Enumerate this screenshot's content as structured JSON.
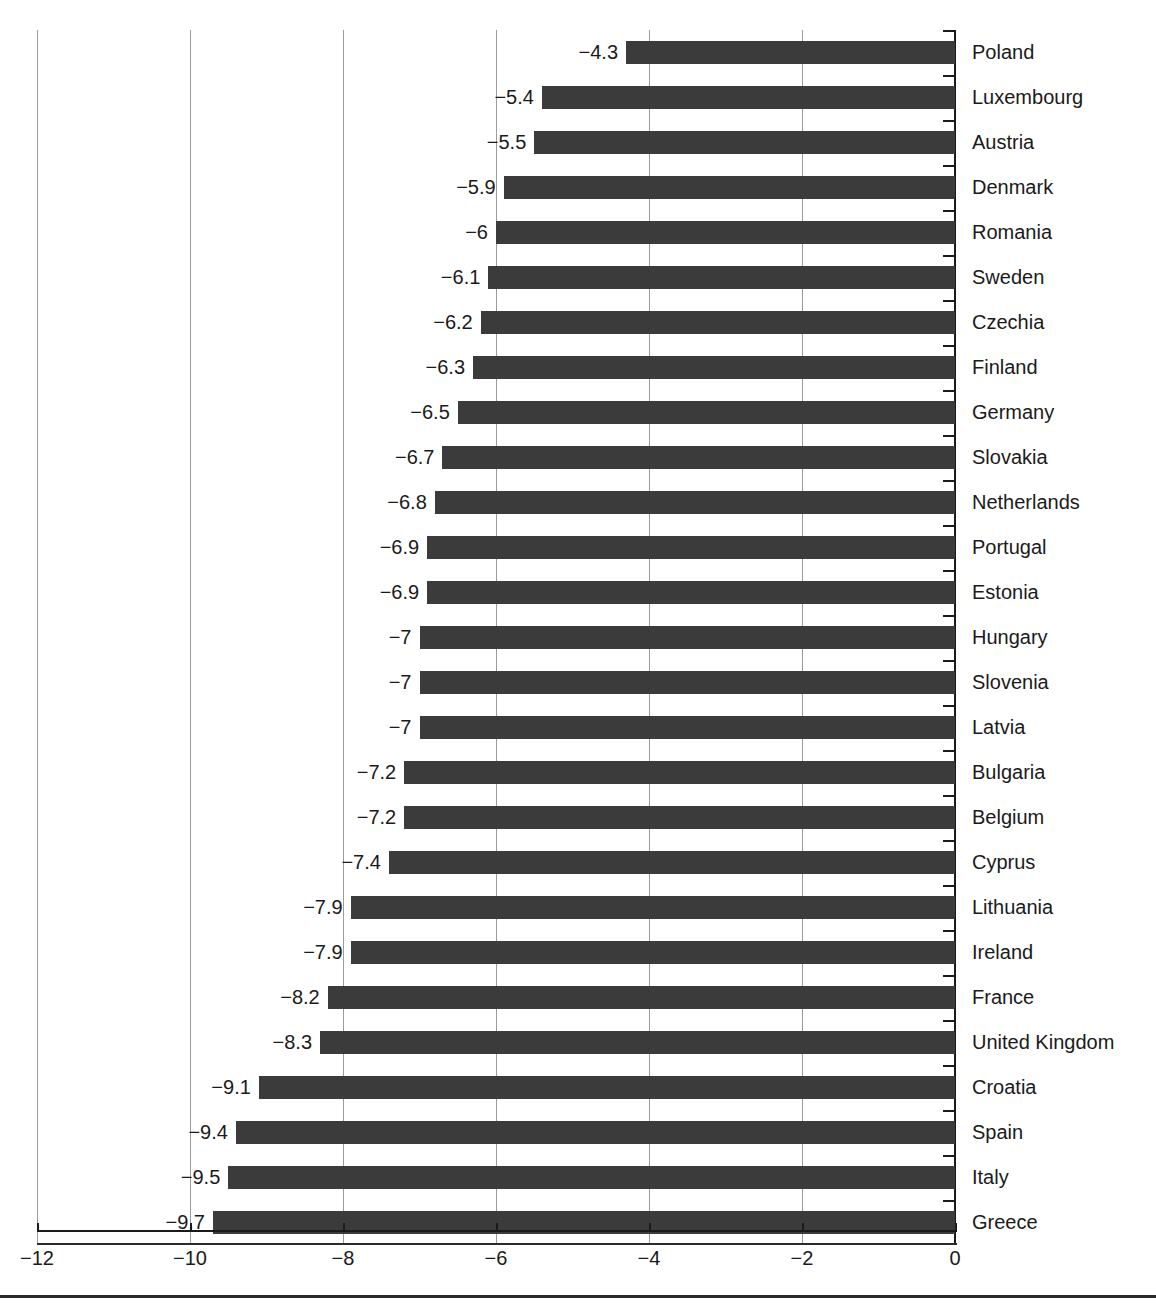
{
  "title": "",
  "axis": {
    "x_ticks": [
      "−12",
      "−10",
      "−8",
      "−6",
      "−4",
      "−2",
      "0"
    ]
  },
  "chart_data": {
    "type": "bar",
    "orientation": "horizontal",
    "title": "",
    "subtitle": "",
    "xlabel": "",
    "ylabel": "",
    "xlim": [
      -12,
      0
    ],
    "xticks": [
      -12,
      -10,
      -8,
      -6,
      -4,
      -2,
      0
    ],
    "xtick_labels": [
      "−12",
      "−10",
      "−8",
      "−6",
      "−4",
      "−2",
      "0"
    ],
    "grid": true,
    "grid_axis": "x",
    "legend": false,
    "bar_color": "#3b3b3b",
    "background_color": "#ffffff",
    "value_labels": true,
    "categories": [
      "Poland",
      "Luxembourg",
      "Austria",
      "Denmark",
      "Romania",
      "Sweden",
      "Czechia",
      "Finland",
      "Germany",
      "Slovakia",
      "Netherlands",
      "Portugal",
      "Estonia",
      "Hungary",
      "Slovenia",
      "Latvia",
      "Bulgaria",
      "Belgium",
      "Cyprus",
      "Lithuania",
      "Ireland",
      "France",
      "United Kingdom",
      "Croatia",
      "Spain",
      "Italy",
      "Greece"
    ],
    "values": [
      -4.3,
      -5.4,
      -5.5,
      -5.9,
      -6,
      -6.1,
      -6.2,
      -6.3,
      -6.5,
      -6.7,
      -6.8,
      -6.9,
      -6.9,
      -7,
      -7,
      -7,
      -7.2,
      -7.2,
      -7.4,
      -7.9,
      -7.9,
      -8.2,
      -8.3,
      -9.1,
      -9.4,
      -9.5,
      -9.7
    ],
    "value_label_texts": [
      "−4.3",
      "−5.4",
      "−5.5",
      "−5.9",
      "−6",
      "−6.1",
      "−6.2",
      "−6.3",
      "−6.5",
      "−6.7",
      "−6.8",
      "−6.9",
      "−6.9",
      "−7",
      "−7",
      "−7",
      "−7.2",
      "−7.2",
      "−7.4",
      "−7.9",
      "−7.9",
      "−8.2",
      "−8.3",
      "−9.1",
      "−9.4",
      "−9.5",
      "−9.7"
    ]
  }
}
